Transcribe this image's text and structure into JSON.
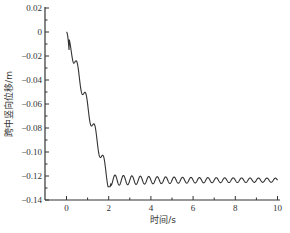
{
  "chart_data": {
    "type": "line",
    "title": "",
    "xlabel": "时间/s",
    "ylabel": "跨中竖向位移/m",
    "xlim": [
      -1,
      10.2
    ],
    "ylim": [
      -0.14,
      0.02
    ],
    "xticks": [
      0,
      2,
      4,
      6,
      8,
      10
    ],
    "xtick_labels": [
      "0",
      "2",
      "4",
      "6",
      "8",
      "10"
    ],
    "yticks": [
      0.02,
      0,
      -0.02,
      -0.04,
      -0.06,
      -0.08,
      -0.1,
      -0.12,
      -0.14
    ],
    "ytick_labels": [
      "0.02",
      "0",
      "−0.02",
      "−0.04",
      "−0.06",
      "−0.08",
      "−0.10",
      "−0.12",
      "−0.14"
    ],
    "grid": false,
    "legend": null,
    "line_color": "#333333",
    "series": [
      {
        "name": "跨中竖向位移",
        "x": [
          0,
          0.1,
          0.2,
          0.3,
          0.4,
          0.5,
          0.6,
          0.7,
          0.8,
          0.9,
          1.0,
          1.1,
          1.2,
          1.3,
          1.4,
          1.5,
          1.6,
          1.7,
          1.8,
          1.9,
          2.0,
          2.1,
          2.3,
          2.5,
          2.7,
          2.9,
          3.1,
          3.3,
          3.5,
          4.0,
          5.0,
          6.0,
          7.0,
          8.0,
          9.0,
          10.0
        ],
        "values": [
          0,
          -0.002,
          -0.01,
          -0.02,
          -0.025,
          -0.026,
          -0.03,
          -0.04,
          -0.048,
          -0.052,
          -0.055,
          -0.065,
          -0.075,
          -0.078,
          -0.08,
          -0.09,
          -0.1,
          -0.105,
          -0.108,
          -0.118,
          -0.127,
          -0.128,
          -0.12,
          -0.127,
          -0.12,
          -0.127,
          -0.121,
          -0.126,
          -0.121,
          -0.123,
          -0.123,
          -0.123,
          -0.123,
          -0.123,
          -0.123,
          -0.123
        ],
        "oscillation": {
          "start_time": 2.1,
          "center": -0.1235,
          "initial_amplitude": 0.0045,
          "final_amplitude": 0.0015,
          "period_s": 0.4
        }
      }
    ]
  }
}
